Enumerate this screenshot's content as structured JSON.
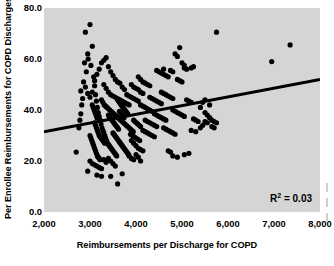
{
  "chart_data": {
    "type": "scatter",
    "title": "",
    "xlabel": "Reimbursements per Discharge for COPD",
    "ylabel": "Per Enrollee Reimbursements for COPD Discharges",
    "xlim": [
      2000,
      8000
    ],
    "ylim": [
      0,
      80
    ],
    "xticks": [
      2000,
      3000,
      4000,
      5000,
      6000,
      7000,
      8000
    ],
    "xticklabels": [
      "2,000",
      "3,000",
      "4,000",
      "5,000",
      "6,000",
      "7,000",
      "8,000"
    ],
    "yticks": [
      0,
      20,
      40,
      60,
      80
    ],
    "yticklabels": [
      "0.0",
      "20.0",
      "40.0",
      "60.0",
      "80.0"
    ],
    "grid": false,
    "legend": null,
    "plot_background": "#d5d5d5",
    "figure_background": "#ffffff",
    "marker_color": "#000000",
    "marker_size": 5.2,
    "annotations": [
      {
        "text": "R2 = 0.03",
        "label": "R",
        "sup": "2",
        "rest": " = 0.03",
        "position": "lower-right"
      }
    ],
    "trendline": {
      "type": "linear",
      "color": "#000000",
      "width": 3.0,
      "x0": 2000,
      "y0": 31.5,
      "x1": 8000,
      "y1": 52.0
    },
    "points": [
      [
        2800,
        47.5
      ],
      [
        2700,
        23.5
      ],
      [
        2900,
        70.5
      ],
      [
        3000,
        73.5
      ],
      [
        2950,
        62.0
      ],
      [
        3050,
        65.0
      ],
      [
        2880,
        58.5
      ],
      [
        2920,
        55.0
      ],
      [
        2860,
        51.0
      ],
      [
        2840,
        44.5
      ],
      [
        2820,
        42.0
      ],
      [
        2800,
        38.5
      ],
      [
        2780,
        36.0
      ],
      [
        2760,
        33.0
      ],
      [
        2960,
        60.0
      ],
      [
        3020,
        57.5
      ],
      [
        3080,
        53.0
      ],
      [
        3100,
        49.5
      ],
      [
        3120,
        46.0
      ],
      [
        3140,
        43.5
      ],
      [
        3160,
        41.0
      ],
      [
        3180,
        39.0
      ],
      [
        3200,
        37.5
      ],
      [
        3220,
        36.0
      ],
      [
        3240,
        34.5
      ],
      [
        3260,
        33.0
      ],
      [
        3280,
        32.0
      ],
      [
        3300,
        31.0
      ],
      [
        3320,
        30.0
      ],
      [
        3340,
        29.0
      ],
      [
        3360,
        28.0
      ],
      [
        3380,
        27.0
      ],
      [
        3400,
        26.5
      ],
      [
        3420,
        26.0
      ],
      [
        3440,
        25.5
      ],
      [
        3460,
        25.0
      ],
      [
        3480,
        24.5
      ],
      [
        3500,
        24.0
      ],
      [
        3520,
        23.5
      ],
      [
        3540,
        23.0
      ],
      [
        3560,
        22.5
      ],
      [
        3580,
        22.0
      ],
      [
        3300,
        50.0
      ],
      [
        3350,
        48.5
      ],
      [
        3400,
        47.0
      ],
      [
        3450,
        46.0
      ],
      [
        3500,
        45.5
      ],
      [
        3550,
        45.0
      ],
      [
        3600,
        44.5
      ],
      [
        3650,
        44.0
      ],
      [
        3700,
        43.5
      ],
      [
        3750,
        43.0
      ],
      [
        3800,
        42.5
      ],
      [
        3850,
        42.0
      ],
      [
        3250,
        44.0
      ],
      [
        3280,
        43.0
      ],
      [
        3310,
        42.0
      ],
      [
        3340,
        41.5
      ],
      [
        3370,
        41.0
      ],
      [
        3400,
        40.5
      ],
      [
        3430,
        40.0
      ],
      [
        3460,
        39.5
      ],
      [
        3490,
        39.0
      ],
      [
        3520,
        38.5
      ],
      [
        3550,
        38.0
      ],
      [
        3580,
        37.5
      ],
      [
        3610,
        37.0
      ],
      [
        3640,
        36.5
      ],
      [
        3670,
        36.0
      ],
      [
        3700,
        35.5
      ],
      [
        3730,
        35.0
      ],
      [
        3760,
        34.5
      ],
      [
        3790,
        34.0
      ],
      [
        3820,
        33.5
      ],
      [
        3850,
        33.0
      ],
      [
        3880,
        32.5
      ],
      [
        3910,
        32.0
      ],
      [
        3940,
        31.5
      ],
      [
        3400,
        38.0
      ],
      [
        3420,
        37.5
      ],
      [
        3440,
        37.0
      ],
      [
        3460,
        36.5
      ],
      [
        3480,
        36.0
      ],
      [
        3500,
        35.5
      ],
      [
        3520,
        35.0
      ],
      [
        3540,
        34.5
      ],
      [
        3560,
        34.0
      ],
      [
        3580,
        33.5
      ],
      [
        3600,
        33.0
      ],
      [
        3620,
        32.5
      ],
      [
        3640,
        39.5
      ],
      [
        3660,
        39.0
      ],
      [
        3680,
        38.5
      ],
      [
        3700,
        38.0
      ],
      [
        3720,
        37.5
      ],
      [
        3740,
        37.0
      ],
      [
        3100,
        35.0
      ],
      [
        3120,
        34.0
      ],
      [
        3140,
        33.0
      ],
      [
        3160,
        32.0
      ],
      [
        3180,
        31.0
      ],
      [
        3200,
        30.0
      ],
      [
        3220,
        29.5
      ],
      [
        3240,
        29.0
      ],
      [
        3260,
        28.5
      ],
      [
        3280,
        28.0
      ],
      [
        3300,
        27.5
      ],
      [
        3320,
        27.0
      ],
      [
        3050,
        42.0
      ],
      [
        3070,
        41.0
      ],
      [
        3090,
        40.0
      ],
      [
        3110,
        39.0
      ],
      [
        3130,
        38.0
      ],
      [
        3150,
        37.0
      ],
      [
        3000,
        30.0
      ],
      [
        3020,
        29.0
      ],
      [
        3040,
        28.0
      ],
      [
        3060,
        27.0
      ],
      [
        3080,
        26.0
      ],
      [
        3100,
        25.0
      ],
      [
        3120,
        24.0
      ],
      [
        3140,
        23.0
      ],
      [
        3160,
        22.0
      ],
      [
        3180,
        21.5
      ],
      [
        3200,
        21.0
      ],
      [
        3220,
        20.5
      ],
      [
        3000,
        20.0
      ],
      [
        3050,
        19.0
      ],
      [
        3100,
        18.5
      ],
      [
        3150,
        18.0
      ],
      [
        3200,
        17.5
      ],
      [
        3250,
        17.0
      ],
      [
        3300,
        20.5
      ],
      [
        3350,
        19.5
      ],
      [
        3400,
        21.0
      ],
      [
        3450,
        20.0
      ],
      [
        3500,
        19.0
      ],
      [
        3550,
        18.0
      ],
      [
        2950,
        16.0
      ],
      [
        3150,
        14.5
      ],
      [
        3250,
        14.0
      ],
      [
        3450,
        14.0
      ],
      [
        3600,
        11.0
      ],
      [
        3700,
        15.0
      ],
      [
        3850,
        22.0
      ],
      [
        3900,
        21.0
      ],
      [
        3950,
        20.5
      ],
      [
        4000,
        22.5
      ],
      [
        4050,
        21.5
      ],
      [
        4100,
        20.0
      ],
      [
        3900,
        28.0
      ],
      [
        3950,
        27.0
      ],
      [
        4000,
        26.0
      ],
      [
        4050,
        25.0
      ],
      [
        4100,
        24.5
      ],
      [
        4150,
        24.0
      ],
      [
        3880,
        30.5
      ],
      [
        3920,
        30.0
      ],
      [
        3960,
        29.5
      ],
      [
        4000,
        29.0
      ],
      [
        4040,
        28.5
      ],
      [
        4080,
        28.0
      ],
      [
        3800,
        46.0
      ],
      [
        3850,
        45.5
      ],
      [
        3900,
        45.0
      ],
      [
        3950,
        44.5
      ],
      [
        4000,
        44.0
      ],
      [
        4050,
        43.5
      ],
      [
        3900,
        50.0
      ],
      [
        3950,
        49.0
      ],
      [
        4000,
        48.5
      ],
      [
        4050,
        48.0
      ],
      [
        4100,
        47.0
      ],
      [
        4150,
        46.5
      ],
      [
        4050,
        53.0
      ],
      [
        4100,
        52.0
      ],
      [
        4150,
        51.0
      ],
      [
        4200,
        50.5
      ],
      [
        4250,
        50.0
      ],
      [
        4300,
        49.5
      ],
      [
        4100,
        42.0
      ],
      [
        4150,
        41.5
      ],
      [
        4200,
        41.0
      ],
      [
        4250,
        40.5
      ],
      [
        4300,
        40.0
      ],
      [
        4350,
        39.5
      ],
      [
        4200,
        36.0
      ],
      [
        4250,
        35.5
      ],
      [
        4300,
        35.0
      ],
      [
        4350,
        34.5
      ],
      [
        4400,
        34.0
      ],
      [
        4450,
        33.5
      ],
      [
        4150,
        32.0
      ],
      [
        4200,
        31.5
      ],
      [
        4250,
        31.0
      ],
      [
        4300,
        30.5
      ],
      [
        4350,
        30.0
      ],
      [
        4400,
        29.5
      ],
      [
        4300,
        45.0
      ],
      [
        4350,
        44.5
      ],
      [
        4400,
        44.0
      ],
      [
        4450,
        43.5
      ],
      [
        4500,
        43.0
      ],
      [
        4550,
        42.5
      ],
      [
        4400,
        38.5
      ],
      [
        4450,
        38.0
      ],
      [
        4500,
        37.5
      ],
      [
        4550,
        37.0
      ],
      [
        4600,
        36.5
      ],
      [
        4650,
        36.0
      ],
      [
        4450,
        55.5
      ],
      [
        4500,
        55.0
      ],
      [
        4550,
        54.5
      ],
      [
        4600,
        54.0
      ],
      [
        4650,
        53.5
      ],
      [
        4700,
        53.0
      ],
      [
        4550,
        47.0
      ],
      [
        4600,
        46.5
      ],
      [
        4650,
        46.0
      ],
      [
        4700,
        45.5
      ],
      [
        4750,
        45.0
      ],
      [
        4800,
        44.5
      ],
      [
        4600,
        33.0
      ],
      [
        4650,
        32.5
      ],
      [
        4700,
        32.0
      ],
      [
        4750,
        31.5
      ],
      [
        4800,
        31.0
      ],
      [
        4850,
        30.5
      ],
      [
        4700,
        24.0
      ],
      [
        4750,
        23.5
      ],
      [
        4800,
        22.0
      ],
      [
        4900,
        21.5
      ],
      [
        5050,
        22.5
      ],
      [
        5150,
        23.0
      ],
      [
        4800,
        40.0
      ],
      [
        4850,
        39.5
      ],
      [
        4900,
        39.0
      ],
      [
        4950,
        38.5
      ],
      [
        5000,
        38.0
      ],
      [
        5050,
        37.5
      ],
      [
        4900,
        52.0
      ],
      [
        4950,
        51.5
      ],
      [
        5000,
        51.0
      ],
      [
        5050,
        56.5
      ],
      [
        5100,
        56.0
      ],
      [
        5200,
        56.5
      ],
      [
        4850,
        62.0
      ],
      [
        4900,
        61.0
      ],
      [
        4950,
        64.5
      ],
      [
        5000,
        58.5
      ],
      [
        5050,
        57.5
      ],
      [
        4800,
        55.0
      ],
      [
        5100,
        44.0
      ],
      [
        5150,
        43.5
      ],
      [
        5200,
        43.0
      ],
      [
        5250,
        36.5
      ],
      [
        5300,
        36.0
      ],
      [
        5350,
        35.5
      ],
      [
        5200,
        32.0
      ],
      [
        5300,
        31.5
      ],
      [
        5400,
        33.0
      ],
      [
        5450,
        34.0
      ],
      [
        5500,
        35.5
      ],
      [
        5550,
        35.0
      ],
      [
        5500,
        39.0
      ],
      [
        5550,
        38.0
      ],
      [
        5600,
        37.0
      ],
      [
        5650,
        36.0
      ],
      [
        5700,
        35.5
      ],
      [
        5750,
        35.0
      ],
      [
        5650,
        33.5
      ],
      [
        5700,
        33.0
      ],
      [
        5500,
        44.0
      ],
      [
        5450,
        43.0
      ],
      [
        5600,
        42.0
      ],
      [
        5400,
        41.0
      ],
      [
        5750,
        70.5
      ],
      [
        6950,
        59.0
      ],
      [
        7350,
        65.5
      ],
      [
        5250,
        57.0
      ],
      [
        4600,
        56.0
      ],
      [
        4750,
        55.5
      ],
      [
        3600,
        44.0
      ],
      [
        3620,
        43.5
      ],
      [
        3640,
        43.0
      ],
      [
        3660,
        42.5
      ],
      [
        3680,
        42.0
      ],
      [
        3700,
        41.5
      ],
      [
        3720,
        41.0
      ],
      [
        3740,
        40.5
      ],
      [
        3760,
        40.0
      ],
      [
        3780,
        39.5
      ],
      [
        3800,
        39.0
      ],
      [
        3820,
        38.5
      ],
      [
        3500,
        31.0
      ],
      [
        3520,
        30.5
      ],
      [
        3540,
        30.0
      ],
      [
        3560,
        29.5
      ],
      [
        3580,
        29.0
      ],
      [
        3600,
        28.5
      ],
      [
        3620,
        28.0
      ],
      [
        3640,
        27.5
      ],
      [
        3660,
        27.0
      ],
      [
        3680,
        26.5
      ],
      [
        3700,
        26.0
      ],
      [
        3720,
        25.5
      ],
      [
        3740,
        25.0
      ],
      [
        3760,
        24.5
      ],
      [
        3780,
        24.0
      ],
      [
        3800,
        23.5
      ],
      [
        3820,
        23.0
      ],
      [
        3840,
        22.5
      ],
      [
        2900,
        49.0
      ],
      [
        2950,
        46.5
      ],
      [
        3000,
        45.0
      ],
      [
        3050,
        47.0
      ],
      [
        3100,
        51.5
      ],
      [
        3150,
        54.0
      ],
      [
        3200,
        56.0
      ],
      [
        3250,
        58.5
      ],
      [
        3300,
        59.5
      ],
      [
        3350,
        60.5
      ],
      [
        3400,
        57.0
      ],
      [
        3450,
        55.0
      ],
      [
        3500,
        53.5
      ],
      [
        3550,
        52.0
      ],
      [
        3600,
        51.0
      ],
      [
        3650,
        50.5
      ],
      [
        3700,
        49.0
      ],
      [
        3750,
        48.0
      ],
      [
        3950,
        36.0
      ],
      [
        3980,
        35.5
      ],
      [
        4010,
        35.0
      ],
      [
        4040,
        34.5
      ],
      [
        4070,
        34.0
      ],
      [
        4100,
        33.5
      ]
    ]
  },
  "side_marks_count": 3
}
